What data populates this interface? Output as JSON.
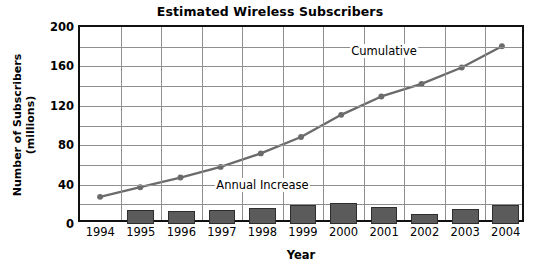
{
  "chart_data": {
    "type": "bar",
    "title": "Estimated Wireless Subscribers",
    "xlabel": "Year",
    "ylabel": "Number of Subscribers\n(millions)",
    "ylabel_line1": "Number of Subscribers",
    "ylabel_line2": "(millions)",
    "categories": [
      "1994",
      "1995",
      "1996",
      "1997",
      "1998",
      "1999",
      "2000",
      "2001",
      "2002",
      "2003",
      "2004"
    ],
    "x": [
      1994,
      1995,
      1996,
      1997,
      1998,
      1999,
      2000,
      2001,
      2002,
      2003,
      2004
    ],
    "ylim": [
      0,
      200
    ],
    "xlim_categories": [
      "1994",
      "2004"
    ],
    "yticks": [
      0,
      40,
      80,
      120,
      160,
      200
    ],
    "ytick_labels": [
      "0",
      "40",
      "80",
      "120",
      "160",
      "200"
    ],
    "y_minor_ticks": [
      20,
      60,
      100,
      140,
      180
    ],
    "grid": true,
    "grid_axes": "both",
    "legend": "inline-annotations",
    "series": [
      {
        "name": "Cumulative",
        "type": "line",
        "color": "#6b6b6b",
        "marker": "circle",
        "values": [
          24,
          34,
          44,
          55,
          69,
          86,
          109,
          128,
          141,
          158,
          180
        ]
      },
      {
        "name": "Annual Increase",
        "type": "bar",
        "color": "#5b5b5b",
        "values": [
          null,
          14,
          13,
          14,
          16,
          19,
          21,
          17,
          10,
          15,
          19
        ]
      }
    ],
    "annotations": [
      {
        "text": "Cumulative",
        "x": "2001",
        "y": 176
      },
      {
        "text": "Annual Increase",
        "x": "1998",
        "y": 40
      }
    ]
  },
  "colors": {
    "bar_fill": "#5b5b5b",
    "bar_stroke": "#2e2e2e",
    "line": "#6b6b6b",
    "grid": "#8f8f8f",
    "axis": "#111111",
    "background": "#ffffff",
    "text": "#000000"
  }
}
